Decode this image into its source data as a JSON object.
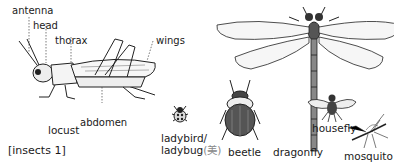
{
  "figure": {
    "caption": "[insects 1]",
    "locust": {
      "name": "locust",
      "parts": {
        "antenna": "antenna",
        "head": "head",
        "thorax": "thorax",
        "wings": "wings",
        "abdomen": "abdomen"
      }
    },
    "ladybird": {
      "line1": "ladybird/",
      "line2": "ladybug",
      "note": "(美)"
    },
    "beetle": "beetle",
    "dragonfly": "dragonfly",
    "housefly": "housefly",
    "mosquito": "mosquito"
  }
}
